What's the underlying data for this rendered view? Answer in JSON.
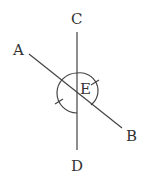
{
  "diagram": {
    "points": {
      "A": "A",
      "B": "B",
      "C": "C",
      "D": "D",
      "E": "E"
    },
    "stroke_color": "#444444"
  }
}
